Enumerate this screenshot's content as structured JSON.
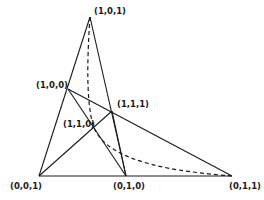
{
  "diagram": {
    "type": "projective-plane-triangle",
    "points": [
      {
        "id": "p101",
        "label": "(1,0,1)",
        "x": 90,
        "y": 17,
        "label_x": 94,
        "label_y": 14
      },
      {
        "id": "p100",
        "label": "(1,0,0)",
        "x": 68,
        "y": 89,
        "label_x": 38,
        "label_y": 88
      },
      {
        "id": "p111",
        "label": "(1,1,1)",
        "x": 112,
        "y": 111,
        "label_x": 117,
        "label_y": 107
      },
      {
        "id": "p110",
        "label": "(1,1,0)",
        "x": 94,
        "y": 128,
        "label_x": 63,
        "label_y": 127
      },
      {
        "id": "p001",
        "label": "(0,0,1)",
        "x": 39,
        "y": 176,
        "label_x": 10,
        "label_y": 189
      },
      {
        "id": "p010",
        "label": "(0,1,0)",
        "x": 126,
        "y": 176,
        "label_x": 113,
        "label_y": 189
      },
      {
        "id": "p011",
        "label": "(0,1,1)",
        "x": 232,
        "y": 176,
        "label_x": 231,
        "label_y": 189
      }
    ],
    "edges": [
      {
        "from": "p101",
        "to": "p001"
      },
      {
        "from": "p101",
        "to": "p010"
      },
      {
        "from": "p001",
        "to": "p011"
      },
      {
        "from": "p100",
        "to": "p011"
      },
      {
        "from": "p100",
        "to": "p010"
      },
      {
        "from": "p001",
        "to": "p111"
      },
      {
        "from": "p111",
        "to": "p010"
      }
    ],
    "dashed_curve": {
      "from": "p101",
      "through": "p110",
      "to": "p011",
      "style": "dashed"
    },
    "colors": {
      "ink": "#1a1a1a",
      "background": "#ffffff"
    }
  }
}
